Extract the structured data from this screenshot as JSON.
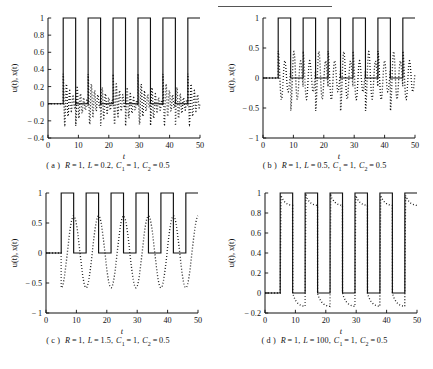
{
  "figure": {
    "top_rule": true,
    "axis_label_x": "t",
    "axis_label_y": "u(t), x(t)"
  },
  "panels": [
    {
      "key": "a",
      "tag": "( a )",
      "caption": "R = 1, L = 0.2, C1 = 1, C2 = 0.5",
      "caption_parts": {
        "R": "R = 1",
        "L": "L = 0.2",
        "C1": "C",
        "C1_sub": "1",
        "C1_val": " = 1",
        "C2": "C",
        "C2_sub": "2",
        "C2_val": " = 0.5"
      }
    },
    {
      "key": "b",
      "tag": "( b )",
      "caption": "R = 1, L = 0.5, C1 = 1, C2 = 0.5",
      "caption_parts": {
        "R": "R = 1",
        "L": "L = 0.5",
        "C1": "C",
        "C1_sub": "1",
        "C1_val": " = 1",
        "C2": "C",
        "C2_sub": "2",
        "C2_val": " = 0.5"
      }
    },
    {
      "key": "c",
      "tag": "( c )",
      "caption": "R = 1, L = 1.5, C1 = 1, C2 = 0.5",
      "caption_parts": {
        "R": "R = 1",
        "L": "L = 1.5",
        "C1": "C",
        "C1_sub": "1",
        "C1_val": " = 1",
        "C2": "C",
        "C2_sub": "2",
        "C2_val": " = 0.5"
      }
    },
    {
      "key": "d",
      "tag": "( d )",
      "caption": "R = 1, L = 100, C1 = 1, C2 = 0.5",
      "caption_parts": {
        "R": "R = 1",
        "L": "L = 100",
        "C1": "C",
        "C1_sub": "1",
        "C1_val": " = 1",
        "C2": "C",
        "C2_sub": "2",
        "C2_val": " = 0.5"
      }
    }
  ],
  "chart_data": [
    {
      "id": "a",
      "type": "line",
      "title": "",
      "xlabel": "t",
      "ylabel": "u(t), x(t)",
      "xlim": [
        0,
        50
      ],
      "ylim": [
        -0.4,
        1.0
      ],
      "xticks": [
        0,
        10,
        20,
        30,
        40,
        50
      ],
      "yticks": [
        -0.4,
        -0.2,
        0,
        0.2,
        0.4,
        0.6,
        0.8,
        1
      ],
      "grid": false,
      "legend": "none",
      "params": {
        "R": 1,
        "L": 0.2,
        "C1": 1,
        "C2": 0.5
      },
      "series": [
        {
          "name": "u(t)",
          "style": "solid",
          "description": "square wave, low 0 high 1, starts high at t=5, period 8.2, duty ~0.5",
          "square_wave": {
            "t_start": 5.0,
            "period": 8.2,
            "duty": 0.5,
            "low": 0,
            "high": 1
          }
        },
        {
          "name": "x(t)",
          "style": "dotted",
          "description": "damped ringing response; fast oscillatory decay each switching edge; peaks ~+0.33, troughs ~-0.25",
          "peak": 0.33,
          "trough": -0.25,
          "ring_freq": 2.8,
          "damping": 0.42
        }
      ]
    },
    {
      "id": "b",
      "type": "line",
      "title": "",
      "xlabel": "t",
      "ylabel": "u(t), x(t)",
      "xlim": [
        0,
        50
      ],
      "ylim": [
        -1.0,
        1.0
      ],
      "xticks": [
        0,
        10,
        20,
        30,
        40,
        50
      ],
      "yticks": [
        -1,
        -0.5,
        0,
        0.5,
        1
      ],
      "grid": false,
      "legend": "none",
      "params": {
        "R": 1,
        "L": 0.5,
        "C1": 1,
        "C2": 0.5
      },
      "series": [
        {
          "name": "u(t)",
          "style": "solid",
          "description": "square wave, low 0 high 1, starts high at t=5, period 8.2, duty ~0.5",
          "square_wave": {
            "t_start": 5.0,
            "period": 8.2,
            "duty": 0.5,
            "low": 0,
            "high": 1
          }
        },
        {
          "name": "x(t)",
          "style": "dotted",
          "description": "underdamped response, peaks ~+0.45, troughs ~-0.55, slower ringing than (a)",
          "peak": 0.45,
          "trough": -0.55,
          "ring_freq": 1.45,
          "damping": 0.2
        }
      ]
    },
    {
      "id": "c",
      "type": "line",
      "title": "",
      "xlabel": "t",
      "ylabel": "u(t), x(t)",
      "xlim": [
        0,
        50
      ],
      "ylim": [
        -1.0,
        1.0
      ],
      "xticks": [
        0,
        10,
        20,
        30,
        40,
        50
      ],
      "yticks": [
        -1,
        -0.5,
        0,
        0.5,
        1
      ],
      "grid": false,
      "legend": "none",
      "params": {
        "R": 1,
        "L": 1.5,
        "C1": 1,
        "C2": 0.5
      },
      "series": [
        {
          "name": "u(t)",
          "style": "solid",
          "description": "square wave, low 0 high 1, starts high at t=5, period 8.2, duty ~0.5",
          "square_wave": {
            "t_start": 5.0,
            "period": 8.2,
            "duty": 0.5,
            "low": 0,
            "high": 1
          }
        },
        {
          "name": "x(t)",
          "style": "dotted",
          "description": "slow smooth triangular ramping; rises to ~+0.62 during high, falls to ~-0.58 during low",
          "peak": 0.62,
          "trough": -0.58,
          "ring_freq": 0.0,
          "damping": 0.0
        }
      ]
    },
    {
      "id": "d",
      "type": "line",
      "title": "",
      "xlabel": "t",
      "ylabel": "u(t), x(t)",
      "xlim": [
        0,
        50
      ],
      "ylim": [
        -0.2,
        1.0
      ],
      "xticks": [
        0,
        10,
        20,
        30,
        40,
        50
      ],
      "yticks": [
        -0.2,
        0,
        0.2,
        0.4,
        0.6,
        0.8,
        1
      ],
      "grid": false,
      "legend": "none",
      "params": {
        "R": 1,
        "L": 100,
        "C1": 1,
        "C2": 0.5
      },
      "series": [
        {
          "name": "u(t)",
          "style": "solid",
          "description": "square wave, low 0 high 1, starts high at t=5, period 8.2, duty ~0.5",
          "square_wave": {
            "t_start": 5.0,
            "period": 8.2,
            "duty": 0.5,
            "low": 0,
            "high": 1
          }
        },
        {
          "name": "x(t)",
          "style": "dotted",
          "description": "closely tracks u(t) with slight droop; high plateau decays 1.0 to ~0.87, low plateau decays 0 to ~-0.13",
          "peak": 1.0,
          "trough": -0.14,
          "ring_freq": 0.0,
          "damping": 0.0
        }
      ]
    }
  ]
}
